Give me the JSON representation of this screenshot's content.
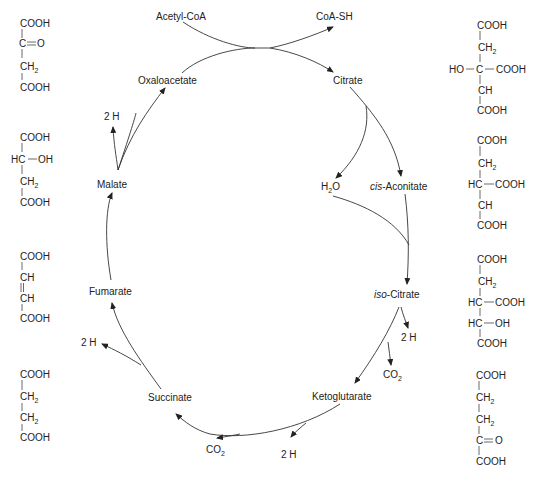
{
  "cycle": {
    "inputs": {
      "acetyl_coa": "Acetyl-CoA",
      "coa_sh": "CoA-SH"
    },
    "intermediates": {
      "oxaloacetate": "Oxaloacetate",
      "citrate": "Citrate",
      "cis_aconitate_prefix": "cis",
      "cis_aconitate_rest": "-Aconitate",
      "iso_citrate_prefix": "iso",
      "iso_citrate_rest": "-Citrate",
      "ketoglutarate": "Ketoglutarate",
      "succinate": "Succinate",
      "fumarate": "Fumarate",
      "malate": "Malate"
    },
    "byproducts": {
      "water_h": "H",
      "water_sub": "2",
      "water_o": "O",
      "co2_co": "CO",
      "co2_sub": "2",
      "two_h": "2 H"
    }
  },
  "structures": {
    "oxaloacetate": {
      "l1": "COOH",
      "l2c": "C",
      "l2r": "O",
      "l3": "CH",
      "l3sub": "2",
      "l4": "COOH"
    },
    "malate": {
      "l1": "COOH",
      "l2l": "HC",
      "l2r": "OH",
      "l3": "CH",
      "l3sub": "2",
      "l4": "COOH"
    },
    "fumarate": {
      "l1": "COOH",
      "l2": "CH",
      "l3": "CH",
      "l4": "COOH"
    },
    "succinate": {
      "l1": "COOH",
      "l2": "CH",
      "l2sub": "2",
      "l3": "CH",
      "l3sub": "2",
      "l4": "COOH"
    },
    "citrate": {
      "l1": "COOH",
      "l2": "CH",
      "l2sub": "2",
      "l3l": "HO",
      "l3c": "C",
      "l3r": "COOH",
      "l4": "CH",
      "l5": "COOH"
    },
    "cis_aconitate": {
      "l1": "COOH",
      "l2": "CH",
      "l2sub": "2",
      "l3l": "HC",
      "l3r": "COOH",
      "l4": "CH",
      "l5": "COOH"
    },
    "iso_citrate": {
      "l1": "COOH",
      "l2": "CH",
      "l2sub": "2",
      "l3l": "HC",
      "l3r": "COOH",
      "l4l": "HC",
      "l4r": "OH",
      "l5": "COOH"
    },
    "ketoglutarate": {
      "l1": "COOH",
      "l2": "CH",
      "l2sub": "2",
      "l3": "CH",
      "l3sub": "2",
      "l4c": "C",
      "l4r": "O",
      "l5": "COOH"
    }
  }
}
